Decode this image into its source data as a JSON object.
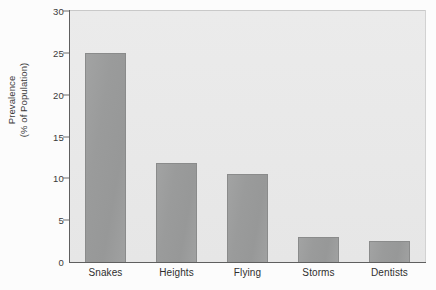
{
  "chart_data": {
    "type": "bar",
    "title": "",
    "subtitle": "",
    "xlabel": "",
    "ylabel_lines": [
      "Prevalence",
      "(% of Population)"
    ],
    "ylabel": "Prevalence (% of Population)",
    "categories": [
      "Snakes",
      "Heights",
      "Flying",
      "Storms",
      "Dentists"
    ],
    "values": [
      25.0,
      11.8,
      10.5,
      3.0,
      2.5
    ],
    "ylim": [
      0,
      30
    ],
    "yticks": [
      0,
      5,
      10,
      15,
      20,
      25,
      30
    ],
    "ytick_labels": [
      "0",
      "5",
      "10",
      "15",
      "20",
      "25",
      "30"
    ],
    "grid": false,
    "legend": null,
    "legend_position": "none",
    "bar_color": "#9a9b9b",
    "bar_edge_color": "#8a8b8b",
    "plot_background": "#e9e9e9",
    "figure_background": "#fcfcfc",
    "axis_color": "#5f5f5f",
    "text_color": "#2f2f2f"
  }
}
